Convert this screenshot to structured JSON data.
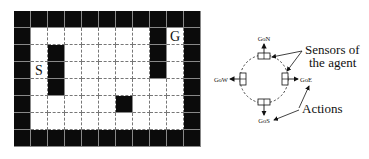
{
  "gridworld": {
    "cols": 11,
    "rows": 8,
    "walls": [
      "11111111111",
      "10000000101",
      "10100000101",
      "10100000101",
      "10100000001",
      "10000010001",
      "10000000001",
      "11111111111"
    ],
    "start": {
      "label": "S",
      "row": 3,
      "col": 1
    },
    "goal": {
      "label": "G",
      "row": 1,
      "col": 9
    }
  },
  "agent_diagram": {
    "actions": {
      "north": "GoN",
      "south": "GoS",
      "west": "GoW",
      "east": "GoE"
    },
    "sensors_label_line1": "Sensors of",
    "sensors_label_line2": "the agent",
    "actions_label": "Actions"
  }
}
